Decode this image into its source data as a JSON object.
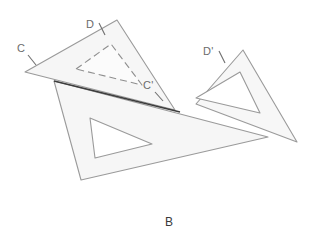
{
  "figure": {
    "caption": "B",
    "caption_pos": {
      "x": 169,
      "y": 226
    },
    "background_color": "#ffffff",
    "stroke_color": "#9a9a9a",
    "stroke_color_dark": "#3c3c3c",
    "fill_color": "#f6f6f6",
    "label_color": "#6b6b6b",
    "labels": [
      {
        "id": "label-C",
        "text": "C",
        "x": 17,
        "y": 52
      },
      {
        "id": "label-D",
        "text": "D",
        "x": 86,
        "y": 28
      },
      {
        "id": "label-D-prime",
        "text": "D'",
        "x": 203,
        "y": 55
      },
      {
        "id": "label-C-prime",
        "text": "C'",
        "x": 143,
        "y": 89
      }
    ],
    "tick_marks": [
      {
        "id": "tick-C",
        "x1": 28,
        "y1": 55,
        "x2": 36,
        "y2": 65
      },
      {
        "id": "tick-D",
        "x1": 99,
        "y1": 24,
        "x2": 105,
        "y2": 35
      },
      {
        "id": "tick-D-prime",
        "x1": 219,
        "y1": 52,
        "x2": 225,
        "y2": 63
      },
      {
        "id": "tick-C-prime",
        "x1": 155,
        "y1": 92,
        "x2": 163,
        "y2": 100
      }
    ],
    "shapes": [
      {
        "id": "upper-left-set-square",
        "name": "triangle-upper-left",
        "outer": "25,72 117,20 175,110",
        "inner": "76,69 111,44 142,85",
        "inner_dashed": true
      },
      {
        "id": "large-lower-set-square",
        "name": "triangle-large-lower",
        "outer": "54,81 81,180 268,137",
        "inner": "90,118 152,144 95,158",
        "inner_dashed": false
      },
      {
        "id": "right-set-square",
        "name": "triangle-right",
        "outer": "243,50 297,142 196,104",
        "inner": "240,72 260,113 196,98",
        "inner_dashed": false
      }
    ],
    "emphasis_edge": {
      "id": "emphasis-edge-top-of-large-triangle",
      "x1": 54,
      "y1": 81,
      "x2": 180,
      "y2": 112
    }
  }
}
